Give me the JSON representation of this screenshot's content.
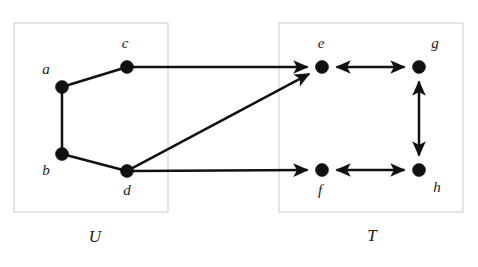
{
  "figure": {
    "background_color": "#ffffff",
    "width": 478,
    "height": 267
  },
  "style": {
    "node_color": "#111111",
    "edge_color": "#111111",
    "box_border_color": "#cfcfcf",
    "label_color": "#1a1a1a",
    "node_radius": 6.5,
    "edge_width": 2.5
  },
  "groups": [
    {
      "id": "U",
      "label": "U",
      "label_x": 95,
      "label_y": 238,
      "box": {
        "x": 14,
        "y": 23,
        "width": 154,
        "height": 189
      }
    },
    {
      "id": "T",
      "label": "T",
      "label_x": 372,
      "label_y": 237,
      "box": {
        "x": 279,
        "y": 23,
        "width": 184,
        "height": 189
      }
    }
  ],
  "nodes": [
    {
      "id": "a",
      "label": "a",
      "group": "U",
      "x": 62,
      "y": 87,
      "label_x": 46,
      "label_y": 71
    },
    {
      "id": "b",
      "label": "b",
      "group": "U",
      "x": 62,
      "y": 154,
      "label_x": 46,
      "label_y": 172
    },
    {
      "id": "c",
      "label": "c",
      "group": "U",
      "x": 127,
      "y": 67,
      "label_x": 125,
      "label_y": 45
    },
    {
      "id": "d",
      "label": "d",
      "group": "U",
      "x": 127,
      "y": 171,
      "label_x": 127,
      "label_y": 192
    },
    {
      "id": "e",
      "label": "e",
      "group": "T",
      "x": 322,
      "y": 67,
      "label_x": 321,
      "label_y": 45
    },
    {
      "id": "f",
      "label": "f",
      "group": "T",
      "x": 322,
      "y": 170,
      "label_x": 320,
      "label_y": 192
    },
    {
      "id": "g",
      "label": "g",
      "group": "T",
      "x": 419,
      "y": 67,
      "label_x": 435,
      "label_y": 45
    },
    {
      "id": "h",
      "label": "h",
      "group": "T",
      "x": 419,
      "y": 170,
      "label_x": 437,
      "label_y": 189
    }
  ],
  "edges": [
    {
      "id": "a-c",
      "from": "a",
      "to": "c",
      "arrow": "none"
    },
    {
      "id": "a-b",
      "from": "a",
      "to": "b",
      "arrow": "none"
    },
    {
      "id": "b-d",
      "from": "b",
      "to": "d",
      "arrow": "none"
    },
    {
      "id": "c-e",
      "from": "c",
      "to": "e",
      "arrow": "forward"
    },
    {
      "id": "d-e",
      "from": "d",
      "to": "e",
      "arrow": "forward"
    },
    {
      "id": "d-f",
      "from": "d",
      "to": "f",
      "arrow": "forward"
    },
    {
      "id": "e-g",
      "from": "e",
      "to": "g",
      "arrow": "both"
    },
    {
      "id": "g-h",
      "from": "g",
      "to": "h",
      "arrow": "both"
    },
    {
      "id": "f-h",
      "from": "f",
      "to": "h",
      "arrow": "both"
    }
  ]
}
